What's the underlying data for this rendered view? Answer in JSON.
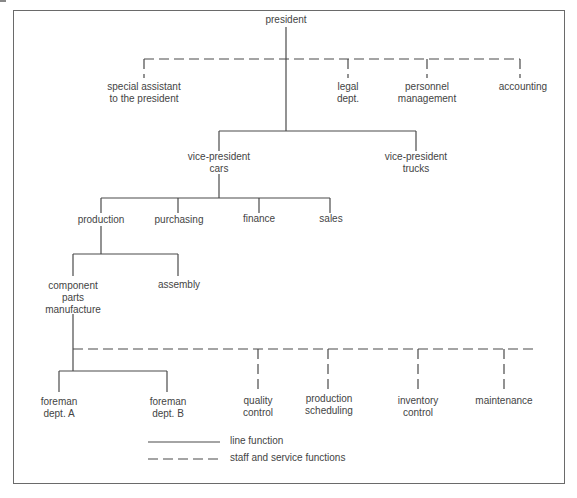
{
  "diagram": {
    "type": "organization-chart",
    "nodes": {
      "president": "president",
      "special_assistant": "special assistant\nto the president",
      "legal": "legal\ndept.",
      "personnel": "personnel\nmanagement",
      "accounting": "accounting",
      "vp_cars": "vice-president\ncars",
      "vp_trucks": "vice-president\ntrucks",
      "production": "production",
      "purchasing": "purchasing",
      "finance": "finance",
      "sales": "sales",
      "component_parts": "component\nparts\nmanufacture",
      "assembly": "assembly",
      "foreman_a": "foreman\ndept. A",
      "foreman_b": "foreman\ndept. B",
      "quality_control": "quality\ncontrol",
      "production_scheduling": "production\nscheduling",
      "inventory_control": "inventory\ncontrol",
      "maintenance": "maintenance"
    },
    "relations": {
      "line": [
        [
          "president",
          "vp_cars"
        ],
        [
          "president",
          "vp_trucks"
        ],
        [
          "vp_cars",
          "production"
        ],
        [
          "vp_cars",
          "purchasing"
        ],
        [
          "vp_cars",
          "finance"
        ],
        [
          "vp_cars",
          "sales"
        ],
        [
          "production",
          "component_parts"
        ],
        [
          "production",
          "assembly"
        ],
        [
          "component_parts",
          "foreman_a"
        ],
        [
          "component_parts",
          "foreman_b"
        ]
      ],
      "staff": [
        [
          "president",
          "special_assistant"
        ],
        [
          "president",
          "legal"
        ],
        [
          "president",
          "personnel"
        ],
        [
          "president",
          "accounting"
        ],
        [
          "component_parts",
          "quality_control"
        ],
        [
          "component_parts",
          "production_scheduling"
        ],
        [
          "component_parts",
          "inventory_control"
        ],
        [
          "component_parts",
          "maintenance"
        ]
      ]
    },
    "legend": {
      "line_function": "line function",
      "staff_functions": "staff and service functions"
    },
    "colors": {
      "line": "#4a4a4a",
      "text": "#444444",
      "frame": "#6a6a6a",
      "background": "#ffffff"
    }
  }
}
